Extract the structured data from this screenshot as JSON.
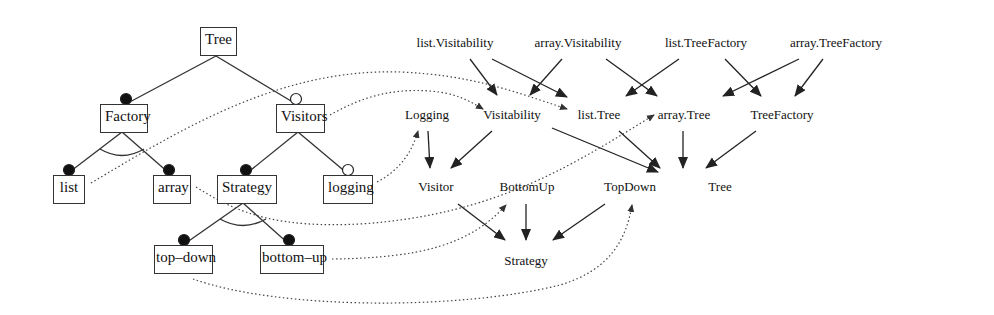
{
  "feature_model": {
    "root": "Tree",
    "nodes": [
      {
        "id": "tree",
        "label": "Tree"
      },
      {
        "id": "factory",
        "label": "Factory"
      },
      {
        "id": "visitors",
        "label": "Visitors"
      },
      {
        "id": "list",
        "label": "list"
      },
      {
        "id": "array",
        "label": "array"
      },
      {
        "id": "strategy",
        "label": "Strategy"
      },
      {
        "id": "logging",
        "label": "logging"
      },
      {
        "id": "top_down",
        "label": "top–down"
      },
      {
        "id": "bottom_up",
        "label": "bottom–up"
      }
    ],
    "edges": [
      {
        "from": "Tree",
        "to": "Factory",
        "kind": "mandatory"
      },
      {
        "from": "Tree",
        "to": "Visitors",
        "kind": "optional"
      },
      {
        "from": "Factory",
        "to": "list",
        "kind": "mandatory",
        "group": "alternative"
      },
      {
        "from": "Factory",
        "to": "array",
        "kind": "mandatory",
        "group": "alternative"
      },
      {
        "from": "Visitors",
        "to": "Strategy",
        "kind": "mandatory"
      },
      {
        "from": "Visitors",
        "to": "logging",
        "kind": "optional"
      },
      {
        "from": "Strategy",
        "to": "top-down",
        "kind": "mandatory",
        "group": "alternative"
      },
      {
        "from": "Strategy",
        "to": "bottom-up",
        "kind": "mandatory",
        "group": "alternative"
      }
    ]
  },
  "module_graph": {
    "nodes": [
      {
        "id": "list_visitability",
        "label": "list.Visitability"
      },
      {
        "id": "array_visitability",
        "label": "array.Visitability"
      },
      {
        "id": "list_treefactory",
        "label": "list.TreeFactory"
      },
      {
        "id": "array_treefactory",
        "label": "array.TreeFactory"
      },
      {
        "id": "logging",
        "label": "Logging"
      },
      {
        "id": "visitability",
        "label": "Visitability"
      },
      {
        "id": "list_tree",
        "label": "list.Tree"
      },
      {
        "id": "array_tree",
        "label": "array.Tree"
      },
      {
        "id": "treefactory",
        "label": "TreeFactory"
      },
      {
        "id": "visitor",
        "label": "Visitor"
      },
      {
        "id": "bottomup",
        "label": "BottomUp"
      },
      {
        "id": "topdown",
        "label": "TopDown"
      },
      {
        "id": "tree",
        "label": "Tree"
      },
      {
        "id": "strategy",
        "label": "Strategy"
      }
    ],
    "edges": [
      [
        "list.Visitability",
        "Visitability"
      ],
      [
        "list.Visitability",
        "list.Tree"
      ],
      [
        "array.Visitability",
        "Visitability"
      ],
      [
        "array.Visitability",
        "array.Tree"
      ],
      [
        "list.TreeFactory",
        "list.Tree"
      ],
      [
        "list.TreeFactory",
        "TreeFactory"
      ],
      [
        "array.TreeFactory",
        "array.Tree"
      ],
      [
        "array.TreeFactory",
        "TreeFactory"
      ],
      [
        "Logging",
        "Visitor"
      ],
      [
        "Visitability",
        "Visitor"
      ],
      [
        "Visitability",
        "Tree"
      ],
      [
        "list.Tree",
        "Tree"
      ],
      [
        "array.Tree",
        "Tree"
      ],
      [
        "TreeFactory",
        "Tree"
      ],
      [
        "Visitor",
        "Strategy"
      ],
      [
        "BottomUp",
        "Strategy"
      ],
      [
        "TopDown",
        "Strategy"
      ]
    ]
  },
  "mappings": [
    [
      "Factory",
      "list.Tree"
    ],
    [
      "Visitors",
      "Visitability"
    ],
    [
      "list",
      "array.Tree"
    ],
    [
      "array",
      "Visitor"
    ],
    [
      "logging",
      "Logging"
    ],
    [
      "bottom-up",
      "BottomUp"
    ],
    [
      "top-down",
      "TopDown"
    ]
  ]
}
